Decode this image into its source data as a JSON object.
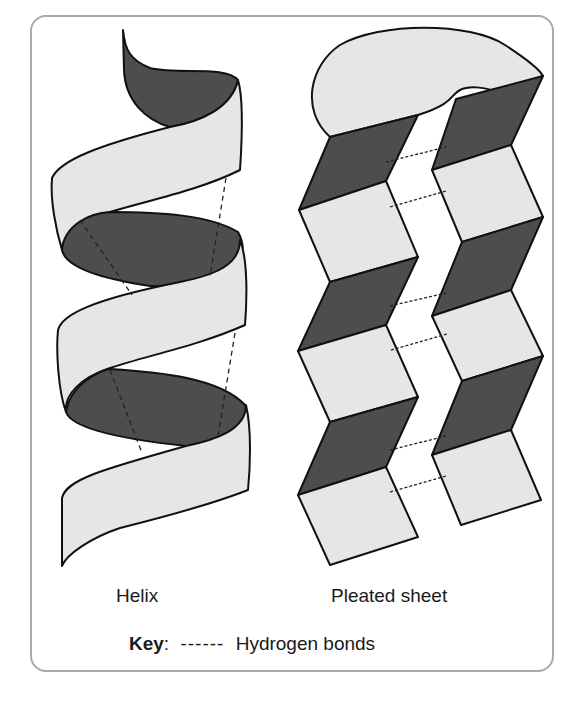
{
  "figure": {
    "helix_label": "Helix",
    "sheet_label": "Pleated sheet",
    "key_label": "Key",
    "key_colon": ":",
    "key_symbol": "------",
    "key_text": "Hydrogen bonds"
  },
  "colors": {
    "dark_face": "#4d4d4d",
    "light_face": "#e6e6e6",
    "outline": "#111111",
    "panel_border": "#a9a9a9"
  }
}
